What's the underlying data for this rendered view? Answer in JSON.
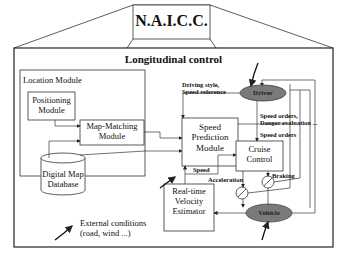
{
  "header": {
    "title": "N.A.I.C.C."
  },
  "main": {
    "title": "Longitudinal control"
  },
  "location_module": {
    "label": "Location Module",
    "positioning": "Positioning Module",
    "map_matching": "Map-Matching Module",
    "database": "Digital Map Database"
  },
  "blocks": {
    "speed_prediction": "Speed Prediction Module",
    "cruise_control": "Cruise Control",
    "velocity_estimator": "Real-time Velocity Estimator",
    "driver": "Driver",
    "vehicle": "Vehicle"
  },
  "signals": {
    "driving_style": "Driving style,",
    "speed_reference": "Speed reference",
    "speed_orders_1": "Speed orders,",
    "danger_evaluation": "Danger evaluation ...",
    "speed_orders_2": "Speed orders",
    "speed": "Speed",
    "acceleration": "Acceleration",
    "braking": "Braking"
  },
  "legend": {
    "line1": "External conditions",
    "line2": "(road, wind ...)"
  },
  "colors": {
    "ellipse_fill": "#7a7a7a",
    "line": "#222222"
  }
}
